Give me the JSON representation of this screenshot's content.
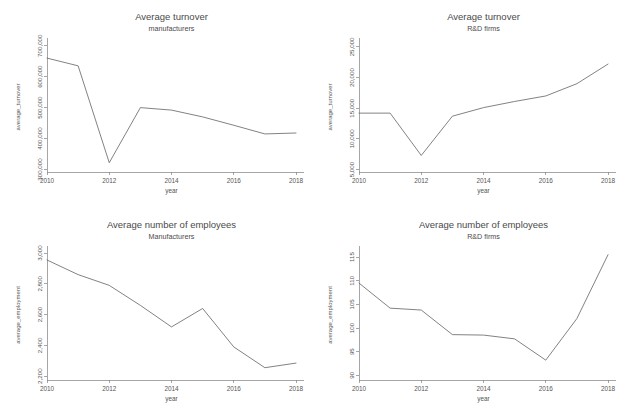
{
  "figure": {
    "background_color": "#ffffff",
    "line_color": "#6b6b6b",
    "axis_color": "#808080",
    "panel_count": 4,
    "layout": "2x2 grid of line charts"
  },
  "chart_data": [
    {
      "id": "turnover-manufacturers",
      "type": "line",
      "title": "Average turnover",
      "subtitle": "manufacturers",
      "xlabel": "year",
      "ylabel": "average_turnover",
      "x": [
        2010,
        2011,
        2012,
        2013,
        2014,
        2015,
        2016,
        2017,
        2018
      ],
      "values": [
        660000,
        635000,
        322000,
        500000,
        492000,
        470000,
        443000,
        415000,
        418000
      ],
      "series": [
        {
          "name": "average_turnover",
          "values": [
            660000,
            635000,
            322000,
            500000,
            492000,
            470000,
            443000,
            415000,
            418000
          ]
        }
      ],
      "xlim": [
        2010,
        2018
      ],
      "ylim": [
        292000,
        712000
      ],
      "xticks": [
        2010,
        2012,
        2014,
        2016,
        2018
      ],
      "xticklabels": [
        "2010",
        "2012",
        "2014",
        "2016",
        "2018"
      ],
      "yticks": [
        300000,
        400000,
        500000,
        600000,
        700000
      ],
      "yticklabels": [
        "300,000",
        "400,000",
        "500,000",
        "600,000",
        "700,000"
      ],
      "grid": false,
      "legend": false
    },
    {
      "id": "turnover-rnd-firms",
      "type": "line",
      "title": "Average turnover",
      "subtitle": "R&D firms",
      "xlabel": "year",
      "ylabel": "average_turnover",
      "x": [
        2010,
        2011,
        2012,
        2013,
        2014,
        2015,
        2016,
        2017,
        2018
      ],
      "values": [
        14200,
        14200,
        7300,
        13700,
        15100,
        16100,
        17000,
        19000,
        22200
      ],
      "series": [
        {
          "name": "average_turnover",
          "values": [
            14200,
            14200,
            7300,
            13700,
            15100,
            16100,
            17000,
            19000,
            22200
          ]
        }
      ],
      "xlim": [
        2010,
        2018
      ],
      "ylim": [
        4600,
        25800
      ],
      "xticks": [
        2010,
        2012,
        2014,
        2016,
        2018
      ],
      "xticklabels": [
        "2010",
        "2012",
        "2014",
        "2016",
        "2018"
      ],
      "yticks": [
        5000,
        10000,
        15000,
        20000,
        25000
      ],
      "yticklabels": [
        "5,000",
        "10,000",
        "15,000",
        "20,000",
        "25,000"
      ],
      "grid": false,
      "legend": false
    },
    {
      "id": "employees-manufacturers",
      "type": "line",
      "title": "Average number of employees",
      "subtitle": "Manufacturers",
      "xlabel": "year",
      "ylabel": "average_employment",
      "x": [
        2010,
        2011,
        2012,
        2013,
        2014,
        2015,
        2016,
        2017,
        2018
      ],
      "values": [
        2955,
        2860,
        2790,
        2660,
        2520,
        2640,
        2390,
        2255,
        2285
      ],
      "series": [
        {
          "name": "average_employment",
          "values": [
            2955,
            2860,
            2790,
            2660,
            2520,
            2640,
            2390,
            2255,
            2285
          ]
        }
      ],
      "xlim": [
        2010,
        2018
      ],
      "ylim": [
        2175,
        3020
      ],
      "xticks": [
        2010,
        2012,
        2014,
        2016,
        2018
      ],
      "xticklabels": [
        "2010",
        "2012",
        "2014",
        "2016",
        "2018"
      ],
      "yticks": [
        2200,
        2400,
        2600,
        2800,
        3000
      ],
      "yticklabels": [
        "2,200",
        "2,400",
        "2,600",
        "2,800",
        "3,000"
      ],
      "grid": false,
      "legend": false
    },
    {
      "id": "employees-rnd-firms",
      "type": "line",
      "title": "Average number of employees",
      "subtitle": "R&D firms",
      "xlabel": "year",
      "ylabel": "average_employment",
      "x": [
        2010,
        2011,
        2012,
        2013,
        2014,
        2015,
        2016,
        2017,
        2018
      ],
      "values": [
        109.5,
        104.2,
        103.8,
        98.6,
        98.5,
        97.7,
        93.2,
        102.0,
        115.5
      ],
      "series": [
        {
          "name": "average_employment",
          "values": [
            109.5,
            104.2,
            103.8,
            98.6,
            98.5,
            97.7,
            93.2,
            102.0,
            115.5
          ]
        }
      ],
      "xlim": [
        2010,
        2018
      ],
      "ylim": [
        89,
        116.5
      ],
      "xticks": [
        2010,
        2012,
        2014,
        2016,
        2018
      ],
      "xticklabels": [
        "2010",
        "2012",
        "2014",
        "2016",
        "2018"
      ],
      "yticks": [
        90,
        95,
        100,
        105,
        110,
        115
      ],
      "yticklabels": [
        "90",
        "95",
        "100",
        "105",
        "110",
        "115"
      ],
      "grid": false,
      "legend": false
    }
  ]
}
